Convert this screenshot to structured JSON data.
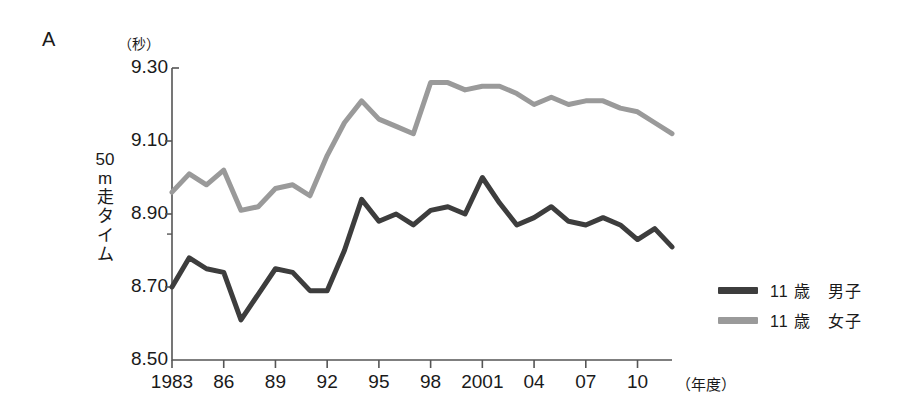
{
  "panel": {
    "letter": "A"
  },
  "axes": {
    "y_unit_label": "（秒）",
    "y_title_chars": [
      "50",
      "m",
      "走",
      "タ",
      "イ",
      "ム"
    ],
    "x_unit_label": "（年度）"
  },
  "legend": {
    "position": "right",
    "items": [
      {
        "label": "11 歳　男子",
        "color": "#3d3d3d"
      },
      {
        "label": "11 歳　女子",
        "color": "#9a9a9a"
      }
    ]
  },
  "chart_data": {
    "type": "line",
    "title": "",
    "subtitle": "",
    "xlabel": "（年度）",
    "ylabel": "50m走タイム（秒）",
    "ylim": [
      8.5,
      9.3
    ],
    "xlim": [
      1983,
      2012
    ],
    "grid": false,
    "yticks": [
      "9.30",
      "9.10",
      "8.90",
      "8.70",
      "8.50"
    ],
    "ytick_values": [
      9.3,
      9.1,
      8.9,
      8.7,
      8.5
    ],
    "xticks": [
      "1983",
      "86",
      "89",
      "92",
      "95",
      "98",
      "2001",
      "04",
      "07",
      "10"
    ],
    "xtick_values": [
      1983,
      1986,
      1989,
      1992,
      1995,
      1998,
      2001,
      2004,
      2007,
      2010
    ],
    "x": [
      1983,
      1984,
      1985,
      1986,
      1987,
      1988,
      1989,
      1990,
      1991,
      1992,
      1993,
      1994,
      1995,
      1996,
      1997,
      1998,
      1999,
      2000,
      2001,
      2002,
      2003,
      2004,
      2005,
      2006,
      2007,
      2008,
      2009,
      2010,
      2011,
      2012
    ],
    "series": [
      {
        "name": "11 歳　男子",
        "color": "#3d3d3d",
        "values": [
          8.7,
          8.78,
          8.75,
          8.74,
          8.61,
          8.68,
          8.75,
          8.74,
          8.69,
          8.69,
          8.8,
          8.94,
          8.88,
          8.9,
          8.87,
          8.91,
          8.92,
          8.9,
          9.0,
          8.93,
          8.87,
          8.89,
          8.92,
          8.88,
          8.87,
          8.89,
          8.87,
          8.83,
          8.86,
          8.81
        ]
      },
      {
        "name": "11 歳　女子",
        "color": "#9a9a9a",
        "values": [
          8.96,
          9.01,
          8.98,
          9.02,
          8.91,
          8.92,
          8.97,
          8.98,
          8.95,
          9.06,
          9.15,
          9.21,
          9.16,
          9.14,
          9.12,
          9.26,
          9.26,
          9.24,
          9.25,
          9.25,
          9.23,
          9.2,
          9.22,
          9.2,
          9.21,
          9.21,
          9.19,
          9.18,
          9.15,
          9.12
        ]
      }
    ]
  },
  "plot_geometry": {
    "left_px": 172,
    "right_px": 672,
    "top_px": 68,
    "bottom_px": 360,
    "axis_color": "#555555",
    "line_width": 5
  }
}
